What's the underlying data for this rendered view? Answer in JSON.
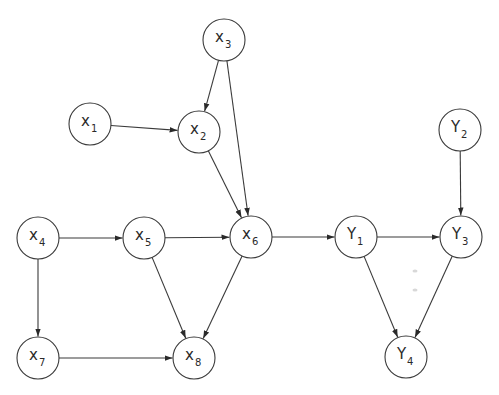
{
  "diagram": {
    "type": "directed-acyclic-graph",
    "node_radius": 21,
    "colors": {
      "stroke": "#3a3a3a",
      "fill": "#ffffff",
      "text": "#2a2a2a",
      "background": "#ffffff"
    },
    "nodes": [
      {
        "id": "X1",
        "main": "x",
        "sub": "1",
        "cx": 90,
        "cy": 124
      },
      {
        "id": "X2",
        "main": "x",
        "sub": "2",
        "cx": 199,
        "cy": 132
      },
      {
        "id": "X3",
        "main": "x",
        "sub": "3",
        "cx": 224,
        "cy": 40
      },
      {
        "id": "X4",
        "main": "x",
        "sub": "4",
        "cx": 38,
        "cy": 238
      },
      {
        "id": "X5",
        "main": "x",
        "sub": "5",
        "cx": 144,
        "cy": 238
      },
      {
        "id": "X6",
        "main": "x",
        "sub": "6",
        "cx": 251,
        "cy": 237
      },
      {
        "id": "X7",
        "main": "x",
        "sub": "7",
        "cx": 38,
        "cy": 358
      },
      {
        "id": "X8",
        "main": "x",
        "sub": "8",
        "cx": 194,
        "cy": 358
      },
      {
        "id": "Y1",
        "main": "Y",
        "sub": "1",
        "cx": 356,
        "cy": 237
      },
      {
        "id": "Y2",
        "main": "Y",
        "sub": "2",
        "cx": 460,
        "cy": 130
      },
      {
        "id": "Y3",
        "main": "Y",
        "sub": "3",
        "cx": 461,
        "cy": 237
      },
      {
        "id": "Y4",
        "main": "Y",
        "sub": "4",
        "cx": 406,
        "cy": 357
      }
    ],
    "edges": [
      {
        "from": "X1",
        "to": "X2"
      },
      {
        "from": "X3",
        "to": "X2"
      },
      {
        "from": "X3",
        "to": "X6"
      },
      {
        "from": "X2",
        "to": "X6"
      },
      {
        "from": "X4",
        "to": "X5"
      },
      {
        "from": "X4",
        "to": "X7"
      },
      {
        "from": "X5",
        "to": "X6"
      },
      {
        "from": "X5",
        "to": "X8"
      },
      {
        "from": "X6",
        "to": "X8"
      },
      {
        "from": "X7",
        "to": "X8"
      },
      {
        "from": "X6",
        "to": "Y1"
      },
      {
        "from": "Y1",
        "to": "Y3"
      },
      {
        "from": "Y2",
        "to": "Y3"
      },
      {
        "from": "Y1",
        "to": "Y4"
      },
      {
        "from": "Y3",
        "to": "Y4"
      }
    ]
  }
}
